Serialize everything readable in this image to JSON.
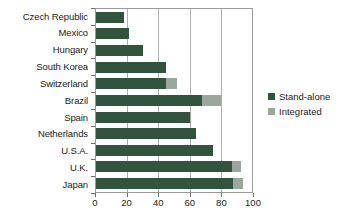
{
  "chart_data": {
    "type": "bar",
    "orientation": "horizontal",
    "stacked": true,
    "title": "",
    "xlabel": "",
    "ylabel": "",
    "xlim": [
      0,
      100
    ],
    "xticks": [
      0,
      20,
      40,
      60,
      80,
      100
    ],
    "grid": "vertical",
    "legend_position": "right",
    "categories": [
      "Czech Republic",
      "Mexico",
      "Hungary",
      "South Korea",
      "Switzerland",
      "Brazil",
      "Spain",
      "Netherlands",
      "U.S.A.",
      "U.K.",
      "Japan"
    ],
    "series": [
      {
        "name": "Stand-alone",
        "color": "#32543c",
        "values": [
          18,
          21,
          30,
          45,
          45,
          68,
          60,
          64,
          75,
          87,
          88
        ]
      },
      {
        "name": "Integrated",
        "color": "#9aa79a",
        "values": [
          0,
          0,
          0,
          0,
          7,
          12,
          1,
          0,
          0,
          6,
          6
        ]
      }
    ]
  },
  "legend": {
    "items": [
      {
        "label": "Stand-alone",
        "color": "#32543c"
      },
      {
        "label": "Integrated",
        "color": "#9aa79a"
      }
    ]
  },
  "axis": {
    "x_tick_labels": [
      "0",
      "20",
      "40",
      "60",
      "80",
      "100"
    ]
  }
}
